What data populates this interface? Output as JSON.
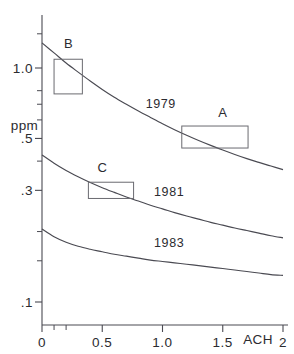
{
  "chart_data": {
    "type": "line",
    "title": "",
    "subtitle": "",
    "xlabel": "ACH",
    "ylabel": "ppm",
    "xscale": "linear",
    "yscale": "log",
    "xlim": [
      0,
      2
    ],
    "ylim": [
      0.08,
      1.55
    ],
    "grid": false,
    "legend": "inline-curve-labels",
    "x_ticks": [
      {
        "value": 0,
        "label": "0"
      },
      {
        "value": 0.5,
        "label": "0.5"
      },
      {
        "value": 1.0,
        "label": "1.0"
      },
      {
        "value": 1.5,
        "label": "1.5"
      },
      {
        "value": 2.0,
        "label": "2"
      }
    ],
    "x_minor_ticks": [
      0.1,
      0.2
    ],
    "y_ticks": [
      {
        "value": 1.0,
        "label": "1.0"
      },
      {
        "value": 0.5,
        "label": ".5"
      },
      {
        "value": 0.3,
        "label": ".3"
      },
      {
        "value": 0.1,
        "label": ".1"
      }
    ],
    "y_minor_ticks": [
      1.4,
      0.8,
      0.7,
      0.6,
      0.4,
      0.2,
      0.15
    ],
    "series": [
      {
        "name": "1979",
        "label": "1979",
        "label_x": 0.86,
        "label_y": 0.7,
        "x": [
          0.0,
          0.1,
          0.2,
          0.3,
          0.4,
          0.5,
          0.6,
          0.7,
          0.8,
          0.9,
          1.0,
          1.1,
          1.2,
          1.3,
          1.4,
          1.5,
          1.6,
          1.7,
          1.8,
          1.9,
          2.0
        ],
        "y": [
          1.28,
          1.16,
          1.05,
          0.96,
          0.88,
          0.81,
          0.75,
          0.7,
          0.655,
          0.615,
          0.578,
          0.545,
          0.516,
          0.49,
          0.467,
          0.446,
          0.427,
          0.41,
          0.395,
          0.381,
          0.368
        ]
      },
      {
        "name": "1981",
        "label": "1981",
        "label_x": 0.93,
        "label_y": 0.295,
        "x": [
          0.0,
          0.1,
          0.2,
          0.3,
          0.4,
          0.5,
          0.6,
          0.7,
          0.8,
          0.9,
          1.0,
          1.1,
          1.2,
          1.3,
          1.4,
          1.5,
          1.6,
          1.7,
          1.8,
          1.9,
          2.0
        ],
        "y": [
          0.425,
          0.392,
          0.365,
          0.343,
          0.324,
          0.308,
          0.294,
          0.281,
          0.27,
          0.259,
          0.25,
          0.241,
          0.233,
          0.226,
          0.219,
          0.213,
          0.207,
          0.202,
          0.197,
          0.192,
          0.188
        ]
      },
      {
        "name": "1983",
        "label": "1983",
        "label_x": 0.93,
        "label_y": 0.178,
        "x": [
          0.0,
          0.1,
          0.2,
          0.3,
          0.4,
          0.5,
          0.6,
          0.7,
          0.8,
          0.9,
          1.0,
          1.1,
          1.2,
          1.3,
          1.4,
          1.5,
          1.6,
          1.7,
          1.8,
          1.9,
          2.0
        ],
        "y": [
          0.205,
          0.19,
          0.18,
          0.173,
          0.168,
          0.164,
          0.16,
          0.157,
          0.154,
          0.151,
          0.149,
          0.147,
          0.145,
          0.143,
          0.141,
          0.139,
          0.137,
          0.135,
          0.133,
          0.131,
          0.13
        ]
      }
    ],
    "annotation_boxes": [
      {
        "label": "A",
        "x0": 1.16,
        "x1": 1.71,
        "y0": 0.455,
        "y1": 0.565,
        "label_x": 1.5,
        "label_y": 0.645
      },
      {
        "label": "B",
        "x0": 0.1,
        "x1": 0.335,
        "y0": 0.775,
        "y1": 1.09,
        "label_x": 0.22,
        "label_y": 1.27
      },
      {
        "label": "C",
        "x0": 0.385,
        "x1": 0.76,
        "y0": 0.277,
        "y1": 0.325,
        "label_x": 0.5,
        "label_y": 0.375
      }
    ]
  },
  "labels": {
    "y_axis_unit": "ppm",
    "x_axis_unit": "ACH",
    "y_tick_1": "1.0",
    "y_tick_05": ".5",
    "y_tick_03": ".3",
    "y_tick_01": ".1",
    "x_tick_0": "0",
    "x_tick_05": "0.5",
    "x_tick_10": "1.0",
    "x_tick_15": "1.5",
    "x_tick_2": "2",
    "series_1979": "1979",
    "series_1981": "1981",
    "series_1983": "1983",
    "box_a": "A",
    "box_b": "B",
    "box_c": "C"
  },
  "colors": {
    "axis": "#4a4a52",
    "curve": "#4a4a52",
    "box": "#6a6a70",
    "text": "#2b2b30",
    "background": "#ffffff"
  }
}
